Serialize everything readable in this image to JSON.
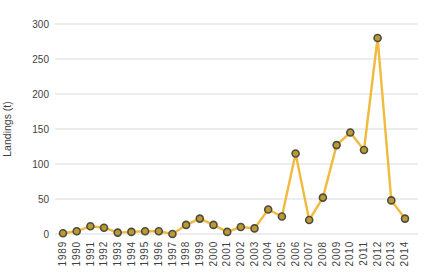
{
  "chart_data": {
    "type": "line",
    "title": "",
    "xlabel": "",
    "ylabel": "Landings (t)",
    "x": [
      "1989",
      "1990",
      "1991",
      "1992",
      "1993",
      "1994",
      "1995",
      "1996",
      "1997",
      "1998",
      "1999",
      "2000",
      "2001",
      "2002",
      "2003",
      "2004",
      "2005",
      "2006",
      "2007",
      "2008",
      "2009",
      "2010",
      "2011",
      "2012",
      "2013",
      "2014"
    ],
    "series": [
      {
        "name": "Landings (t)",
        "values": [
          1,
          4,
          11,
          9,
          2,
          3,
          4,
          4,
          0,
          13,
          22,
          13,
          3,
          10,
          8,
          35,
          25,
          115,
          20,
          52,
          127,
          145,
          120,
          280,
          48,
          22
        ]
      }
    ],
    "ylim": [
      0,
      300
    ],
    "yticks": [
      0,
      50,
      100,
      150,
      200,
      250,
      300
    ],
    "grid": "horizontal",
    "legend_position": "none",
    "x_tick_rotation": -90
  },
  "colors": {
    "line": "#F0BA3E",
    "marker_fill": "#BD9A2F",
    "marker_stroke": "#4E4B41",
    "gridline": "#DBDBDB",
    "tick_text": "#3F3F3F",
    "axis_title_text": "#3F3F3F",
    "background": "#FFFFFF"
  }
}
